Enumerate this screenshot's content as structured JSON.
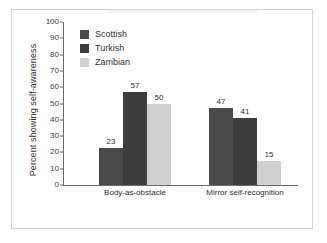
{
  "figure": {
    "background_color": "#ffffff",
    "border_color": "#d2d2d2",
    "axis_color": "#6b6b6b"
  },
  "legend": {
    "position": "top-left-inside",
    "items": [
      {
        "label": "Scottish",
        "color": "#4a4a4a"
      },
      {
        "label": "Turkish",
        "color": "#3d3d3d"
      },
      {
        "label": "Zambian",
        "color": "#cfcfcf"
      }
    ]
  },
  "chart_data": {
    "type": "bar",
    "title": "",
    "xlabel": "",
    "ylabel": "Percent showing self-awareness",
    "ylim": [
      0,
      100
    ],
    "ytick_step": 10,
    "yticks": [
      "100",
      "90",
      "80",
      "70",
      "60",
      "50",
      "40",
      "30",
      "20",
      "10",
      "0"
    ],
    "grid": false,
    "categories": [
      "Body-as-obstacle",
      "Mirror self-recognition"
    ],
    "series": [
      {
        "name": "Scottish",
        "color": "#4a4a4a",
        "values": [
          23,
          47
        ]
      },
      {
        "name": "Turkish",
        "color": "#3d3d3d",
        "values": [
          57,
          41
        ]
      },
      {
        "name": "Zambian",
        "color": "#cfcfcf",
        "values": [
          50,
          15
        ]
      }
    ],
    "data_labels": [
      "23",
      "57",
      "50",
      "47",
      "41",
      "15"
    ]
  }
}
